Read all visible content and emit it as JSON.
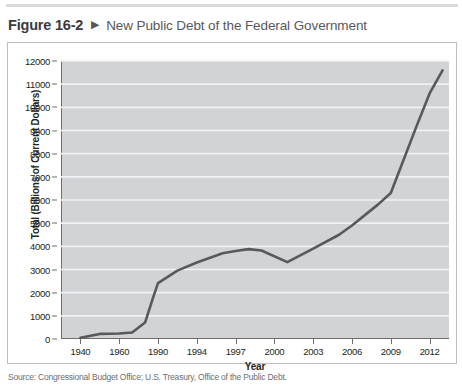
{
  "caption": {
    "figure_number": "Figure 16-2",
    "arrow_icon": "right-triangle-icon",
    "title": "New Public Debt of the Federal Government"
  },
  "source_note": "Source: Congressional Budget Office; U.S. Treasury, Office of the Public Debt.",
  "colors": {
    "plot_background": "#d1d3d4",
    "gridline": "#f1f2f2",
    "line": "#58595b",
    "axis": "#6d6e71",
    "frame": "#bcbec0",
    "caption_accent": "#58585b",
    "top_rule": "#d9dadb"
  },
  "chart_data": {
    "type": "line",
    "title": "New Public Debt of the Federal Government",
    "xlabel": "Year",
    "ylabel": "Total (Billions of Current Dollars)",
    "ylim": [
      0,
      12000
    ],
    "ytick_step": 1000,
    "yticks": [
      0,
      1000,
      2000,
      3000,
      4000,
      5000,
      6000,
      7000,
      8000,
      9000,
      10000,
      11000,
      12000
    ],
    "ytick_labels": [
      "0",
      "1000",
      "2000",
      "3000",
      "4000",
      "5000",
      "6000",
      "7000",
      "8000",
      "9000",
      "10000",
      "11000",
      "12000"
    ],
    "categories": [
      "1940",
      "1960",
      "1990",
      "1994",
      "1997",
      "2000",
      "2003",
      "2006",
      "2009",
      "2012"
    ],
    "xtick_labels": [
      "1940",
      "1960",
      "1990",
      "1994",
      "1997",
      "2000",
      "2003",
      "2006",
      "2009",
      "2012"
    ],
    "grid": true,
    "legend": "none",
    "series": [
      {
        "name": "New Public Debt",
        "units": "Billions of Current Dollars",
        "x": [
          "1940",
          "1950",
          "1960",
          "1970",
          "1980",
          "1986",
          "1990",
          "1992",
          "1994",
          "1996",
          "1997",
          "1998",
          "1999",
          "2001",
          "2003",
          "2005",
          "2006",
          "2008",
          "2009",
          "2011",
          "2012",
          "2013"
        ],
        "values": [
          50,
          220,
          240,
          280,
          710,
          1750,
          2410,
          2950,
          3300,
          3700,
          3800,
          3880,
          3820,
          3320,
          3900,
          4500,
          4900,
          5800,
          6300,
          9200,
          10600,
          11600
        ]
      }
    ],
    "annotations": []
  }
}
